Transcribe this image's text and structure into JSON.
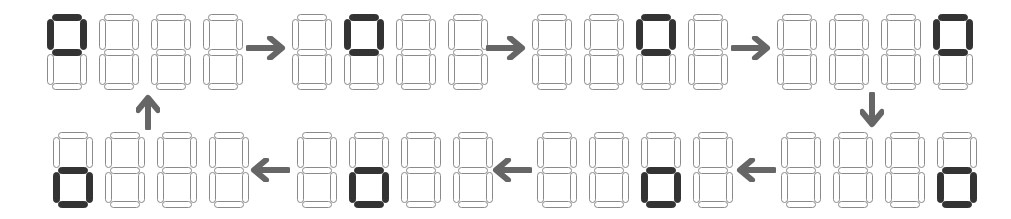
{
  "diagram": {
    "colors": {
      "active_segment": "#333333",
      "inactive_outline": "#8a8a8a",
      "arrow": "#666666",
      "background": "#ffffff"
    },
    "segment_key": [
      "a-top",
      "b-upper-right",
      "c-lower-right",
      "d-bottom",
      "e-lower-left",
      "f-upper-left",
      "g-middle"
    ],
    "displays": [
      {
        "row": "top",
        "order": 1,
        "active_digit": 1,
        "lit_segments": [
          "a",
          "b",
          "f",
          "g"
        ],
        "pattern": "upper-loop"
      },
      {
        "row": "top",
        "order": 2,
        "active_digit": 2,
        "lit_segments": [
          "a",
          "b",
          "f",
          "g"
        ],
        "pattern": "upper-loop"
      },
      {
        "row": "top",
        "order": 3,
        "active_digit": 3,
        "lit_segments": [
          "a",
          "b",
          "f",
          "g"
        ],
        "pattern": "upper-loop"
      },
      {
        "row": "top",
        "order": 4,
        "active_digit": 4,
        "lit_segments": [
          "a",
          "b",
          "f",
          "g"
        ],
        "pattern": "upper-loop"
      },
      {
        "row": "bottom",
        "order": 5,
        "active_digit": 4,
        "lit_segments": [
          "c",
          "d",
          "e",
          "g"
        ],
        "pattern": "lower-loop"
      },
      {
        "row": "bottom",
        "order": 6,
        "active_digit": 3,
        "lit_segments": [
          "c",
          "d",
          "e",
          "g"
        ],
        "pattern": "lower-loop"
      },
      {
        "row": "bottom",
        "order": 7,
        "active_digit": 2,
        "lit_segments": [
          "c",
          "d",
          "e",
          "g"
        ],
        "pattern": "lower-loop"
      },
      {
        "row": "bottom",
        "order": 8,
        "active_digit": 1,
        "lit_segments": [
          "c",
          "d",
          "e",
          "g"
        ],
        "pattern": "lower-loop"
      }
    ],
    "arrows": [
      {
        "from": 1,
        "to": 2,
        "direction": "right"
      },
      {
        "from": 2,
        "to": 3,
        "direction": "right"
      },
      {
        "from": 3,
        "to": 4,
        "direction": "right"
      },
      {
        "from": 4,
        "to": 5,
        "direction": "down"
      },
      {
        "from": 5,
        "to": 6,
        "direction": "left"
      },
      {
        "from": 6,
        "to": 7,
        "direction": "left"
      },
      {
        "from": 7,
        "to": 8,
        "direction": "left"
      },
      {
        "from": 8,
        "to": 1,
        "direction": "up"
      }
    ]
  }
}
